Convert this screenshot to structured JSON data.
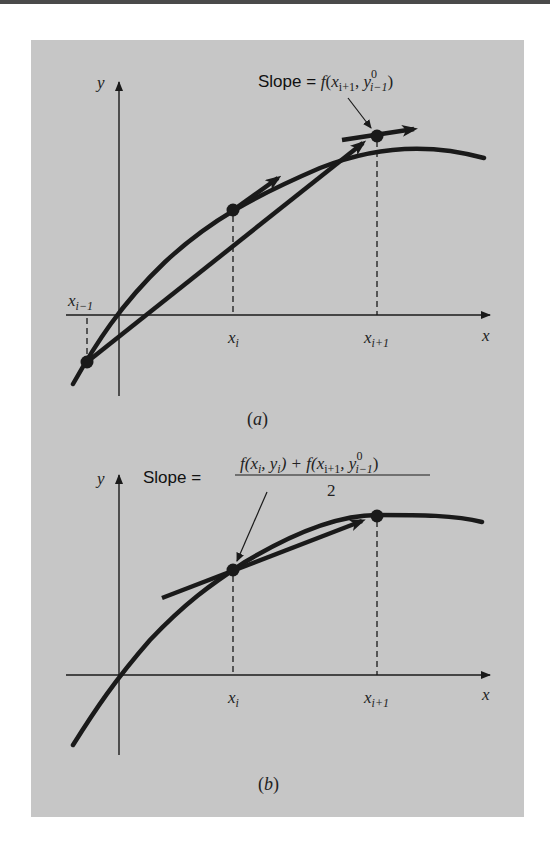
{
  "figure": {
    "panel_a": {
      "caption": "(a)",
      "caption_letter": "a",
      "y_axis_label": "y",
      "x_axis_label": "x",
      "x_ticks": {
        "prev": {
          "base": "x",
          "sub": "i−1"
        },
        "cur": {
          "base": "x",
          "sub": "i"
        },
        "next": {
          "base": "x",
          "sub": "i+1"
        }
      },
      "slope_label": {
        "prefix": "Slope = ",
        "func": "f",
        "open": "(",
        "x": "x",
        "x_sub": "i+1",
        "comma": ", ",
        "y": "y",
        "y_sup": "0",
        "y_sub": "i−1",
        "close": ")"
      }
    },
    "panel_b": {
      "caption": "(b)",
      "caption_letter": "b",
      "y_axis_label": "y",
      "x_axis_label": "x",
      "x_ticks": {
        "cur": {
          "base": "x",
          "sub": "i"
        },
        "next": {
          "base": "x",
          "sub": "i+1"
        }
      },
      "slope_label": {
        "prefix": "Slope = ",
        "numerator_part1": "f(x",
        "numerator_part1_sub": "i",
        "numerator_part2": ", y",
        "numerator_part2_sub": "i",
        "numerator_part3": ") + f(x",
        "numerator_part3_sub": "i+1",
        "numerator_part4": ", y",
        "numerator_part4_sup": "0",
        "numerator_part4_sub": "i−1",
        "numerator_part5": ")",
        "denominator": "2"
      }
    },
    "colors": {
      "panel_background": "#c6c6c6",
      "ink": "#1a1a1a"
    }
  }
}
